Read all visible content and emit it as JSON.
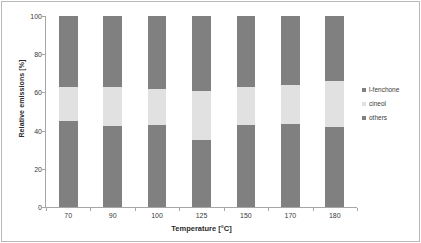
{
  "figure": {
    "background_color": "#ffffff",
    "frame_color": "#b9b9b9"
  },
  "axes": {
    "y": {
      "title": "Relative emissions [%]",
      "ticks": [
        "0",
        "20",
        "40",
        "60",
        "80",
        "100"
      ],
      "min": 0,
      "max": 100
    },
    "x": {
      "title": "Temperature [°C]",
      "ticks": [
        "70",
        "90",
        "100",
        "125",
        "150",
        "170",
        "180"
      ]
    }
  },
  "legend": {
    "position": "right",
    "entries": [
      {
        "label": "l-fenchone",
        "color": "#808080"
      },
      {
        "label": "cineol",
        "color": "#e1e1e1"
      },
      {
        "label": "others",
        "color": "#808080"
      }
    ]
  },
  "chart_data": {
    "type": "bar",
    "stacked": true,
    "stack_total": 100,
    "title": "",
    "xlabel": "Temperature [°C]",
    "ylabel": "Relative emissions [%]",
    "ylim": [
      0,
      100
    ],
    "ytick_step": 20,
    "grid": false,
    "legend_position": "right",
    "categories": [
      "70",
      "90",
      "100",
      "125",
      "150",
      "170",
      "180"
    ],
    "series": [
      {
        "name": "l-fenchone",
        "color": "#808080",
        "stack_order": 3,
        "values": [
          37,
          37,
          38,
          39,
          37,
          36,
          34
        ]
      },
      {
        "name": "cineol",
        "color": "#e1e1e1",
        "stack_order": 2,
        "values": [
          18,
          20.5,
          19,
          26,
          20,
          20.5,
          24
        ]
      },
      {
        "name": "others",
        "color": "#808080",
        "stack_order": 1,
        "values": [
          45,
          42.5,
          43,
          35,
          43,
          43.5,
          42
        ]
      }
    ]
  }
}
